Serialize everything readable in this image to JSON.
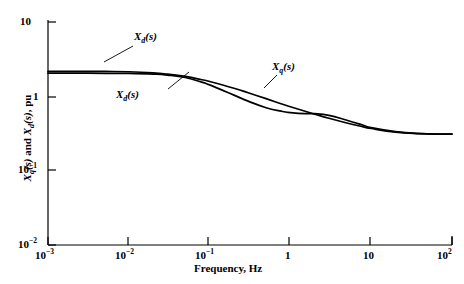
{
  "chart_data": {
    "type": "line",
    "title": "",
    "xlabel": "Frequency, Hz",
    "ylabel": "Xq(s) and Xd(s), pu",
    "xscale": "log",
    "yscale": "log",
    "xlim": [
      0.001,
      100
    ],
    "ylim": [
      0.01,
      10
    ],
    "xticks": [
      0.001,
      0.01,
      0.1,
      1,
      10,
      100
    ],
    "xtick_labels": [
      "10-3",
      "10-2",
      "10-1",
      "1",
      "10",
      "102"
    ],
    "yticks": [
      0.01,
      0.1,
      1,
      10
    ],
    "ytick_labels": [
      "10-2",
      "10-1",
      "1",
      "10"
    ],
    "grid": false,
    "legend": "inline-annotations",
    "series": [
      {
        "name": "Xq(s)",
        "label": "Xq(s)",
        "color": "#000000",
        "points": [
          [
            0.001,
            2.2
          ],
          [
            0.002,
            2.2
          ],
          [
            0.005,
            2.19
          ],
          [
            0.01,
            2.17
          ],
          [
            0.02,
            2.1
          ],
          [
            0.03,
            2.02
          ],
          [
            0.05,
            1.88
          ],
          [
            0.08,
            1.7
          ],
          [
            0.1,
            1.61
          ],
          [
            0.2,
            1.31
          ],
          [
            0.3,
            1.14
          ],
          [
            0.5,
            0.95
          ],
          [
            0.8,
            0.8
          ],
          [
            1.0,
            0.74
          ],
          [
            2.0,
            0.59
          ],
          [
            3.0,
            0.52
          ],
          [
            5.0,
            0.45
          ],
          [
            8.0,
            0.4
          ],
          [
            10.0,
            0.38
          ],
          [
            20.0,
            0.34
          ],
          [
            40.0,
            0.325
          ],
          [
            70.0,
            0.32
          ],
          [
            100.0,
            0.32
          ]
        ]
      },
      {
        "name": "Xd(s)",
        "label": "Xd(s)",
        "color": "#000000",
        "points": [
          [
            0.001,
            2.08
          ],
          [
            0.002,
            2.08
          ],
          [
            0.005,
            2.07
          ],
          [
            0.01,
            2.06
          ],
          [
            0.02,
            2.02
          ],
          [
            0.03,
            1.96
          ],
          [
            0.05,
            1.82
          ],
          [
            0.08,
            1.58
          ],
          [
            0.1,
            1.45
          ],
          [
            0.2,
            1.06
          ],
          [
            0.3,
            0.88
          ],
          [
            0.5,
            0.72
          ],
          [
            0.8,
            0.64
          ],
          [
            1.0,
            0.62
          ],
          [
            1.5,
            0.6
          ],
          [
            2.0,
            0.6
          ],
          [
            3.0,
            0.57
          ],
          [
            5.0,
            0.49
          ],
          [
            8.0,
            0.42
          ],
          [
            10.0,
            0.39
          ],
          [
            20.0,
            0.345
          ],
          [
            40.0,
            0.325
          ],
          [
            70.0,
            0.32
          ],
          [
            100.0,
            0.32
          ]
        ]
      }
    ],
    "annotations": [
      {
        "name": "xd-top",
        "text": "Xd(s)",
        "sub": "d",
        "x_px": 134,
        "y_px": 30
      },
      {
        "name": "xd-lower",
        "text": "Xd(s)",
        "sub": "d",
        "x_px": 116,
        "y_px": 88
      },
      {
        "name": "xq",
        "text": "Xq(s)",
        "sub": "q",
        "x_px": 272,
        "y_px": 60
      }
    ]
  },
  "axes": {
    "x": {
      "title": "Frequency, Hz",
      "ticks": [
        {
          "base": "10",
          "exp": "-3"
        },
        {
          "base": "10",
          "exp": "-2"
        },
        {
          "base": "10",
          "exp": "-1"
        },
        {
          "base": "1",
          "exp": ""
        },
        {
          "base": "10",
          "exp": ""
        },
        {
          "base": "10",
          "exp": "2"
        }
      ]
    },
    "y": {
      "title_parts": {
        "x1": "X",
        "sub1": "q",
        "mid": "(s) and ",
        "x2": "X",
        "sub2": "d",
        "end": "(s), pu"
      },
      "ticks": [
        {
          "base": "10",
          "exp": ""
        },
        {
          "base": "1",
          "exp": ""
        },
        {
          "base": "10",
          "exp": "-1"
        },
        {
          "base": "10",
          "exp": "-2"
        }
      ]
    }
  },
  "curve_labels": {
    "xd_top": {
      "x": "X",
      "sub": "d",
      "rest": "(s)"
    },
    "xd_low": {
      "x": "X",
      "sub": "d",
      "rest": "(s)"
    },
    "xq": {
      "x": "X",
      "sub": "q",
      "rest": "(s)"
    }
  },
  "colors": {
    "background": "#ffffff",
    "axis": "#000000",
    "curve": "#000000"
  }
}
